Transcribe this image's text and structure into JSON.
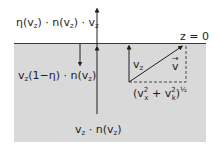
{
  "diagram": {
    "colors": {
      "background": "#ffffff",
      "medium": "#d9d9d9",
      "surface_line": "#3a3a3a",
      "ink": "#1e1e1e"
    },
    "labels": {
      "emitted_flux": {
        "parts": [
          "η(v",
          "z",
          ") · n(v",
          "z",
          ") · v",
          "z"
        ]
      },
      "reflected_flux": {
        "parts": [
          "v",
          "z",
          "(1−η) · n(v",
          "z",
          ")"
        ]
      },
      "incident_flux": {
        "parts": [
          "v",
          "z",
          " · n(v",
          "z",
          ")"
        ]
      },
      "surface": "z = 0",
      "vz_component": {
        "parts": [
          "v",
          "z"
        ]
      },
      "velocity_vector": "v",
      "velocity_vector_arrow": "→",
      "transverse": {
        "open": "(v",
        "x_sup": "2",
        "x_sub": "x",
        "plus": " + v",
        "k_sup": "2",
        "k_sub": "k",
        "close": ")",
        "exp": "½"
      }
    }
  }
}
